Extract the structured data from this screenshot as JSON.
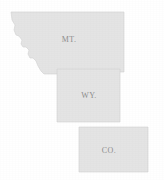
{
  "figure": {
    "name": "three-state-outline-map",
    "background_color": "#ffffff",
    "state_fill_color": "#e4e4e4",
    "state_border_color": "#d2d2d2",
    "label_color": "#8d8d8d",
    "width": 164,
    "height": 180
  },
  "states": [
    {
      "id": "montana",
      "label": "MT.",
      "label_x": 69,
      "label_y": 40,
      "outline": "M11,12 L124,12 L124,72 L75,72 L75,74 L44,74 L41,71 L38,66 L36,61 L33,58 L30,58 L28,54 L29,50 L26,47 L23,47 L21,44 L22,40 L19,36 L16,35 L14,30 L15,25 L12,20 Z"
    },
    {
      "id": "wyoming",
      "label": "WY.",
      "label_x": 89,
      "label_y": 96,
      "outline": "M57,69 L120,69 L120,122 L57,122 Z"
    },
    {
      "id": "colorado",
      "label": "CO.",
      "label_x": 109,
      "label_y": 151,
      "outline": "M79,127 L148,127 L148,172 L79,172 Z"
    }
  ]
}
